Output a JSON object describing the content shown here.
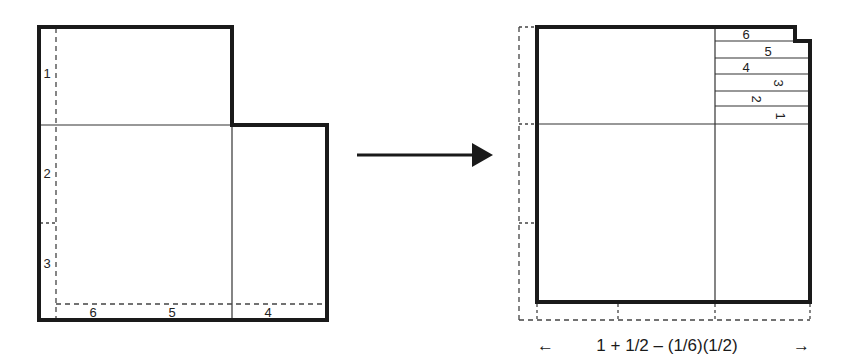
{
  "colors": {
    "ink": "#1a1a1a",
    "thin_line": "#333333",
    "dash": "#444444",
    "background": "#ffffff"
  },
  "left_figure": {
    "description": "L-shaped region with dashed strips numbered 1-6",
    "vertical_labels": [
      "1",
      "2",
      "3"
    ],
    "horizontal_labels": [
      "6",
      "5",
      "4"
    ]
  },
  "transform_arrow": {
    "direction": "right"
  },
  "right_figure": {
    "description": "Square formed by stacking strips 1-6 in top-right corner",
    "strip_labels": [
      "6",
      "5",
      "4",
      "3",
      "2",
      "1"
    ],
    "caption": "1 + 1/2 – (1/6)(1/2)",
    "caption_left_arrow": "←",
    "caption_right_arrow": "→"
  }
}
